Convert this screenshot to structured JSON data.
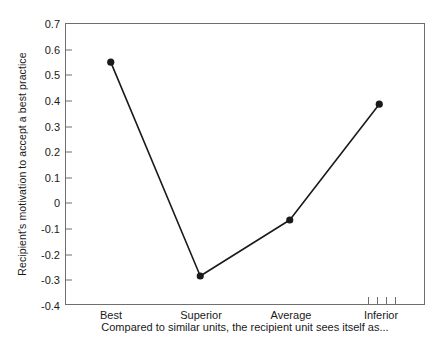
{
  "chart_data": {
    "type": "line",
    "title": "",
    "xlabel": "Compared to similar units, the recipient unit sees itself as...",
    "ylabel": "Recipient's motivation to accept a best practice",
    "categories": [
      "Best",
      "Superior",
      "Average",
      "Inferior"
    ],
    "values": [
      0.55,
      -0.29,
      -0.07,
      0.385
    ],
    "series": [
      {
        "name": "Recipient's motivation",
        "values": [
          0.55,
          -0.29,
          -0.07,
          0.385
        ]
      }
    ],
    "ylim": [
      -0.4,
      0.7
    ],
    "yticks": [
      "0.7",
      "0.6",
      "0.5",
      "0.4",
      "0.3",
      "0.2",
      "0.1",
      "0",
      "-0.1",
      "-0.2",
      "-0.3",
      "-0.4"
    ],
    "ytick_values": [
      0.7,
      0.6,
      0.5,
      0.4,
      0.3,
      0.2,
      0.1,
      0,
      -0.1,
      -0.2,
      -0.3,
      -0.4
    ],
    "grid": false,
    "legend": false,
    "legend_position": "none",
    "marker": "filled-circle",
    "line_color": "#1a1a1a",
    "marker_color": "#1a1a1a",
    "axis_color": "#6f6f6f",
    "extra_xtick_marks": 4
  }
}
